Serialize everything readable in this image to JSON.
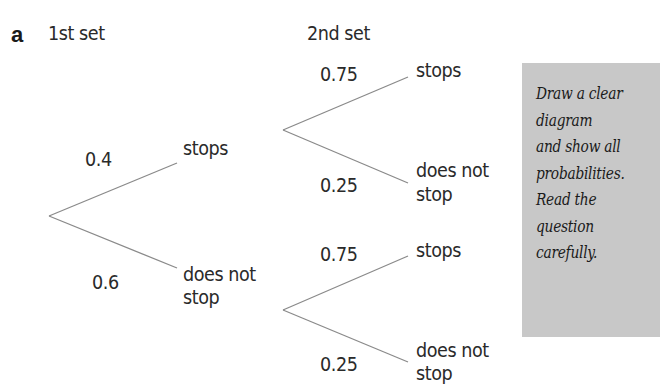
{
  "part_label": "a",
  "headers": {
    "first": "1st set",
    "second": "2nd set"
  },
  "first_set": {
    "upper": {
      "probability": "0.4",
      "outcome": "stops"
    },
    "lower": {
      "probability": "0.6",
      "outcome_line1": "does not",
      "outcome_line2": "stop"
    }
  },
  "second_set_after_stops": {
    "upper": {
      "probability": "0.75",
      "outcome": "stops"
    },
    "lower": {
      "probability": "0.25",
      "outcome_line1": "does not",
      "outcome_line2": "stop"
    }
  },
  "second_set_after_not_stop": {
    "upper": {
      "probability": "0.75",
      "outcome": "stops"
    },
    "lower": {
      "probability": "0.25",
      "outcome_line1": "does not",
      "outcome_line2": "stop"
    }
  },
  "tip_note": "Draw a clear\ndiagram\nand show all\nprobabilities.\nRead the\nquestion\ncarefully.",
  "colors": {
    "line": "#8a8a8a",
    "note_bg": "#c8c8c8",
    "text": "#2a2a2a"
  }
}
